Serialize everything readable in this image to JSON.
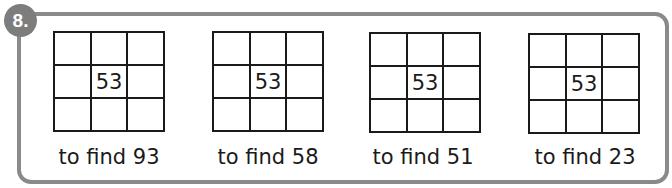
{
  "question": {
    "number_label": "8.",
    "center_value": "53",
    "puzzles": [
      {
        "center": "53",
        "caption": "to find 93"
      },
      {
        "center": "53",
        "caption": "to find 58"
      },
      {
        "center": "53",
        "caption": "to find 51"
      },
      {
        "center": "53",
        "caption": "to find 23"
      }
    ]
  },
  "colors": {
    "frame_border": "#8a8a8a",
    "badge_background": "#7d7d7d",
    "grid_lines": "#1a1a1a"
  }
}
